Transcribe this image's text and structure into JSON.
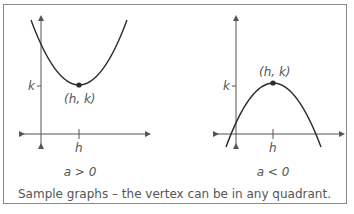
{
  "figure": {
    "caption": "Sample graphs – the vertex can be in any quadrant.",
    "graphs": [
      {
        "id": "upward",
        "condition": "a > 0",
        "vertex_label": "(h, k)",
        "x_tick_label": "h",
        "y_tick_label": "k",
        "opens": "up"
      },
      {
        "id": "downward",
        "condition": "a < 0",
        "vertex_label": "(h, k)",
        "x_tick_label": "h",
        "y_tick_label": "k",
        "opens": "down"
      }
    ],
    "colors": {
      "curve": "#2b2b2b",
      "axes": "#555555",
      "text": "#555555",
      "border": "#8a8a8a"
    }
  }
}
